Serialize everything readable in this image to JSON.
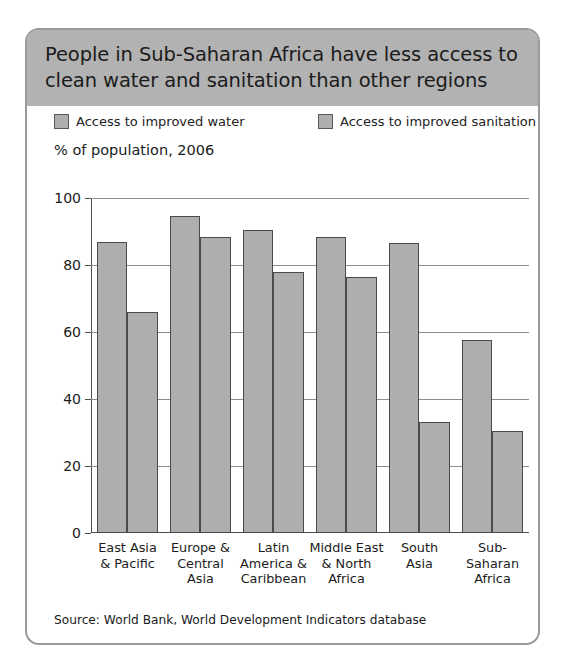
{
  "figure": {
    "title": "People in Sub-Saharan Africa have less access to\nclean water and sanitation than other regions",
    "subtitle": "% of population, 2006",
    "source": "Source: World Bank, World Development Indicators database",
    "title_band_color": "#b2b2b2",
    "bar_fill_color": "#aeaeae",
    "bar_border_color": "#4a4a4a",
    "frame_color": "#9a9a9a"
  },
  "legend": {
    "items": [
      {
        "label": "Access to improved water",
        "swatch": "legend-swatch-water"
      },
      {
        "label": "Access to improved sanitation",
        "swatch": "legend-swatch-sanitation"
      }
    ]
  },
  "chart_data": {
    "type": "bar",
    "title": "People in Sub-Saharan Africa have less access to clean water and sanitation than other regions",
    "subtitle": "% of population, 2006",
    "xlabel": "",
    "ylabel": "% of population, 2006",
    "ylim": [
      0,
      100
    ],
    "yticks": [
      0,
      20,
      40,
      60,
      80,
      100
    ],
    "ytick_labels": [
      "0",
      "20",
      "40",
      "60",
      "80",
      "100"
    ],
    "grid": true,
    "legend_position": "top",
    "categories": [
      "East Asia\n& Pacific",
      "Europe &\nCentral\nAsia",
      "Latin\nAmerica &\nCaribbean",
      "Middle East\n& North\nAfrica",
      "South\nAsia",
      "Sub-\nSaharan\nAfrica"
    ],
    "series": [
      {
        "name": "Access to improved water",
        "values": [
          87,
          94.5,
          90.5,
          88.5,
          86.5,
          57.5
        ]
      },
      {
        "name": "Access to improved sanitation",
        "values": [
          66,
          88.5,
          78,
          76.5,
          33,
          30.5
        ]
      }
    ],
    "source": "Source: World Bank, World Development Indicators database"
  }
}
